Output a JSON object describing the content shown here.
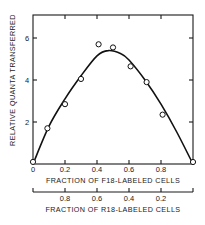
{
  "chart_data": {
    "type": "scatter",
    "title": "",
    "ylabel": "RELATIVE QUANTA TRANSFERRED",
    "xlabel": "FRACTION OF F18-LABELED CELLS",
    "x2label": "FRACTION OF R18-LABELED CELLS",
    "xlim": [
      0,
      1.0
    ],
    "ylim": [
      0,
      7.1
    ],
    "grid": false,
    "legend": null,
    "x_ticks": [
      "0",
      "0.2",
      "0.4",
      "0.6",
      "0.8"
    ],
    "x2_ticks": [
      "0.8",
      "0.6",
      "0.4",
      "0.2"
    ],
    "y_ticks": [
      "2",
      "4",
      "6"
    ],
    "series": [
      {
        "name": "measured",
        "style": "open-circles",
        "x": [
          0.0,
          0.09,
          0.2,
          0.3,
          0.41,
          0.5,
          0.61,
          0.71,
          0.81,
          1.0
        ],
        "y": [
          0.1,
          1.7,
          2.85,
          4.05,
          5.7,
          5.55,
          4.65,
          3.9,
          2.35,
          0.05
        ]
      },
      {
        "name": "fitted-curve",
        "style": "solid-line",
        "x": [
          0.0,
          0.1,
          0.2,
          0.3,
          0.4,
          0.47,
          0.55,
          0.6,
          0.7,
          0.8,
          0.9,
          1.0
        ],
        "y": [
          0.0,
          1.8,
          3.1,
          4.2,
          5.15,
          5.4,
          5.25,
          4.95,
          4.0,
          2.85,
          1.5,
          0.0
        ]
      }
    ]
  },
  "axes": {
    "y_label": "RELATIVE QUANTA TRANSFERRED",
    "x_label": "FRACTION OF F18-LABELED CELLS",
    "x2_label": "FRACTION OF R18-LABELED CELLS",
    "x_tick_labels": [
      "0",
      "0.2",
      "0.4",
      "0.6",
      "0.8"
    ],
    "x2_tick_labels": [
      "0.8",
      "0.6",
      "0.4",
      "0.2"
    ],
    "y_tick_labels": [
      "2",
      "4",
      "6"
    ]
  }
}
